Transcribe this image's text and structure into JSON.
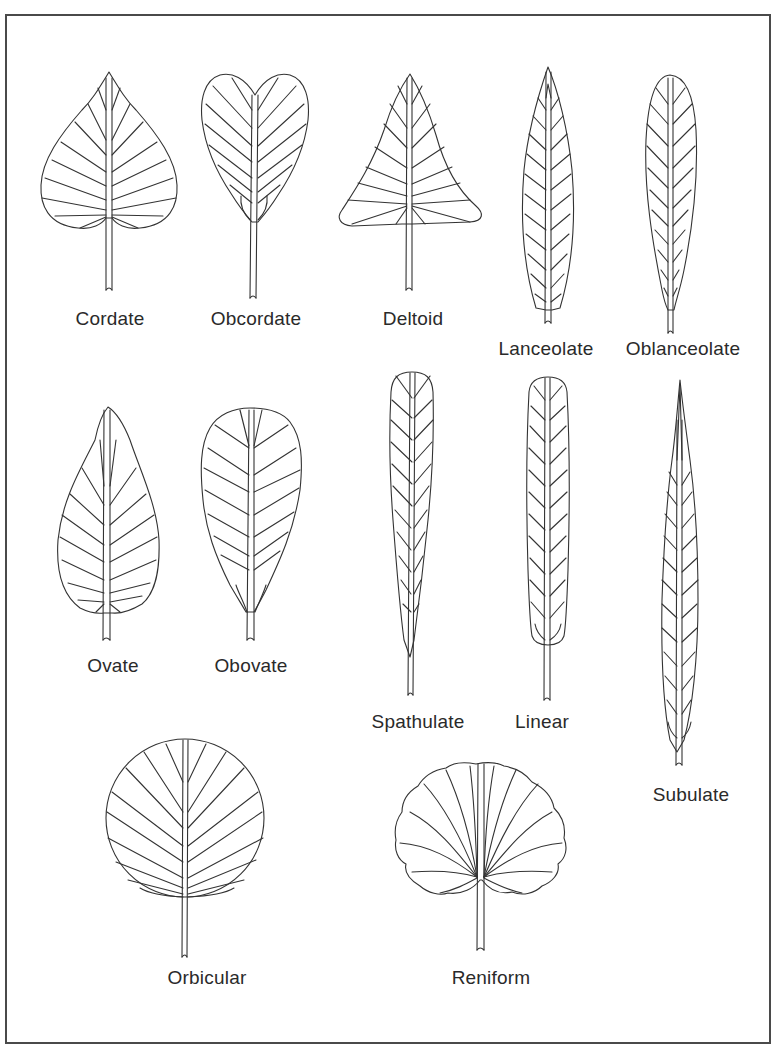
{
  "figure": {
    "leaves": [
      {
        "id": "cordate",
        "label": "Cordate"
      },
      {
        "id": "obcordate",
        "label": "Obcordate"
      },
      {
        "id": "deltoid",
        "label": "Deltoid"
      },
      {
        "id": "lanceolate",
        "label": "Lanceolate"
      },
      {
        "id": "oblanceolate",
        "label": "Oblanceolate"
      },
      {
        "id": "ovate",
        "label": "Ovate"
      },
      {
        "id": "obovate",
        "label": "Obovate"
      },
      {
        "id": "spathulate",
        "label": "Spathulate"
      },
      {
        "id": "linear",
        "label": "Linear"
      },
      {
        "id": "subulate",
        "label": "Subulate"
      },
      {
        "id": "orbicular",
        "label": "Orbicular"
      },
      {
        "id": "reniform",
        "label": "Reniform"
      }
    ]
  },
  "colors": {
    "line": "#333333",
    "border": "#4a4a4a",
    "background": "#ffffff"
  }
}
